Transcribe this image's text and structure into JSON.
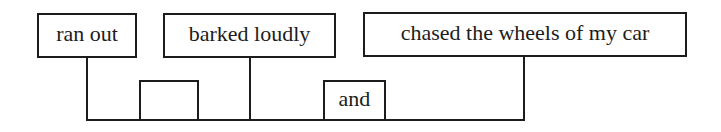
{
  "diagram": {
    "type": "sentence-diagram-compound-predicate",
    "predicates": [
      {
        "label": "ran out"
      },
      {
        "label": "barked loudly"
      },
      {
        "label": "chased the wheels of my car"
      }
    ],
    "connectors": [
      {
        "label": ""
      },
      {
        "label": "and"
      }
    ],
    "colors": {
      "line": "#1c1c1c",
      "text": "#1c1c1c",
      "background": "#ffffff"
    }
  }
}
